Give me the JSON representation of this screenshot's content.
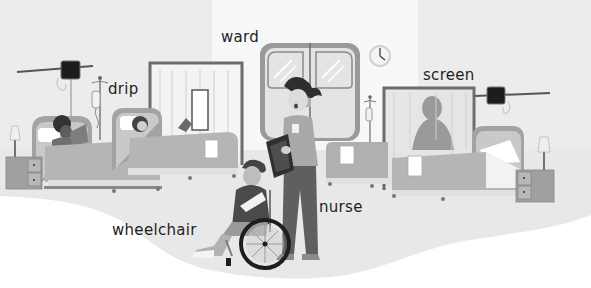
{
  "illustration": {
    "subject": "hospital ward",
    "palette": {
      "wall": "#ececec",
      "wall_light": "#f6f6f6",
      "floor": "#e9e9e9",
      "paper": "#ffffff",
      "bed": "#a9a9a9",
      "bed_dark": "#8e8e8e",
      "blanket": "#b5b5b5",
      "frame": "#7c7c7c",
      "dark": "#2a2a2a",
      "text": "#1e1e1e"
    }
  },
  "labels": {
    "ward": "ward",
    "drip": "drip",
    "screen": "screen",
    "nurse": "nurse",
    "wheelchair": "wheelchair"
  }
}
